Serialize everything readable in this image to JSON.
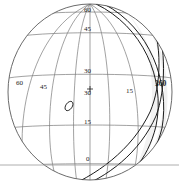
{
  "figure": {
    "type": "sphere-graticule-diagram",
    "background_color": "#ffffff",
    "outline_color": "#555555",
    "grid_color": "#777777",
    "highlight_color": "#111111",
    "shade_color": "#f0f0f0",
    "baseline_color": "#999999",
    "width": 179,
    "height": 191
  },
  "sphere": {
    "center_x": 90,
    "center_y": 92,
    "radius_x": 82,
    "radius_y": 88
  },
  "labels": {
    "latitudes": [
      {
        "text": "60",
        "x": 85,
        "y": 11
      },
      {
        "text": "45",
        "x": 85,
        "y": 30
      },
      {
        "text": "30",
        "x": 85,
        "y": 72
      },
      {
        "text": "15",
        "x": 85,
        "y": 122
      },
      {
        "text": "0",
        "x": 86,
        "y": 159
      }
    ],
    "longitudes": [
      {
        "text": "60",
        "x": 17,
        "y": 83
      },
      {
        "text": "45",
        "x": 41,
        "y": 86
      },
      {
        "text": "15",
        "x": 127,
        "y": 91
      },
      {
        "text": "360",
        "x": 156,
        "y": 84,
        "bold": true
      }
    ],
    "marker_value": {
      "text": "30",
      "x": 85,
      "y": 92
    }
  },
  "markers": {
    "point_label": "plus-marker",
    "ellipse_label": "ellipse-region-marker"
  },
  "baseline": {
    "y": 165
  }
}
